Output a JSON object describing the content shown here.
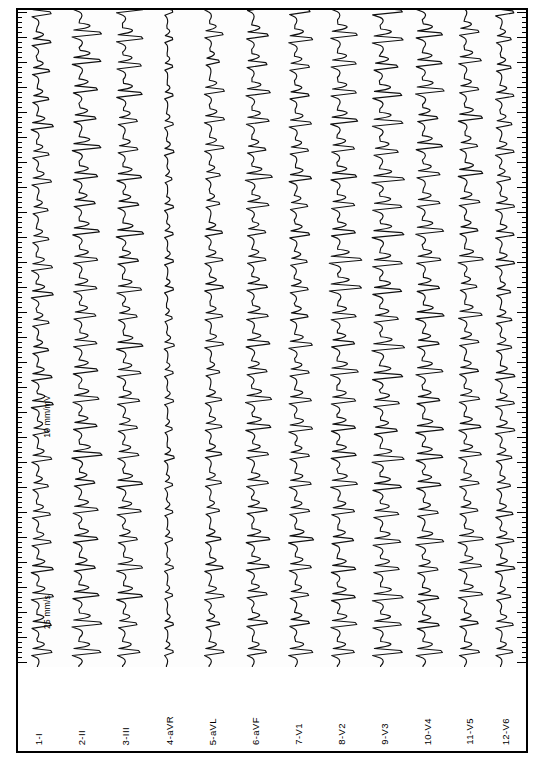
{
  "document": {
    "type": "12-lead electrocardiogram strip",
    "orientation": "rotated 90 degrees (landscape page, traces run vertically)"
  },
  "annotations": {
    "speed": "25 mm/s",
    "gain": "10 mm/mV"
  },
  "leads": [
    {
      "index": "1",
      "name": "I",
      "label": "1-I"
    },
    {
      "index": "2",
      "name": "II",
      "label": "2-II"
    },
    {
      "index": "3",
      "name": "III",
      "label": "3-III"
    },
    {
      "index": "4",
      "name": "aVR",
      "label": "4-aVR"
    },
    {
      "index": "5",
      "name": "aVL",
      "label": "5-aVL"
    },
    {
      "index": "6",
      "name": "aVF",
      "label": "6-aVF"
    },
    {
      "index": "7",
      "name": "V1",
      "label": "7-V1"
    },
    {
      "index": "8",
      "name": "V2",
      "label": "8-V2"
    },
    {
      "index": "9",
      "name": "V3",
      "label": "9-V3"
    },
    {
      "index": "10",
      "name": "V4",
      "label": "10-V4"
    },
    {
      "index": "11",
      "name": "V5",
      "label": "11-V5"
    },
    {
      "index": "12",
      "name": "V6",
      "label": "12-V6"
    }
  ],
  "chart_data": {
    "type": "line",
    "title": "",
    "subtitle": "",
    "xlabel": "",
    "ylabel": "",
    "grid": false,
    "legend_position": "bottom",
    "axis_note": "traces drawn vertically; time runs bottom-to-top along page height, amplitude runs horizontally per lead channel",
    "paper_speed_mm_per_s": 25,
    "gain_mm_per_mV": 10,
    "time_axis_ruler": {
      "minor_tick_px": 5,
      "major_tick_px": 25,
      "minor_per_major": 5
    },
    "categories": [
      "I",
      "II",
      "III",
      "aVR",
      "aVL",
      "aVF",
      "V1",
      "V2",
      "V3",
      "V4",
      "V5",
      "V6"
    ],
    "series": [
      {
        "name": "1-I",
        "baseline_px": 35,
        "amplitude_mm": 9,
        "beats": 22,
        "morphology": "wide biphasic complexes, overlapping"
      },
      {
        "name": "2-II",
        "baseline_px": 78,
        "amplitude_mm": 12,
        "beats": 22,
        "morphology": "tall broad complexes"
      },
      {
        "name": "3-III",
        "baseline_px": 122,
        "amplitude_mm": 11,
        "beats": 22,
        "morphology": "broad complexes"
      },
      {
        "name": "4-aVR",
        "baseline_px": 166,
        "amplitude_mm": 4,
        "beats": 22,
        "morphology": "low amplitude, narrow deflections"
      },
      {
        "name": "5-aVL",
        "baseline_px": 209,
        "amplitude_mm": 8,
        "beats": 22,
        "morphology": "moderate complexes"
      },
      {
        "name": "6-aVF",
        "baseline_px": 252,
        "amplitude_mm": 11,
        "beats": 22,
        "morphology": "broad complexes"
      },
      {
        "name": "7-V1",
        "baseline_px": 295,
        "amplitude_mm": 10,
        "beats": 22,
        "morphology": "broad complexes"
      },
      {
        "name": "8-V2",
        "baseline_px": 338,
        "amplitude_mm": 13,
        "beats": 22,
        "morphology": "large amplitude, overlapping neighbours"
      },
      {
        "name": "9-V3",
        "baseline_px": 381,
        "amplitude_mm": 13,
        "beats": 22,
        "morphology": "large amplitude"
      },
      {
        "name": "10-V4",
        "baseline_px": 424,
        "amplitude_mm": 12,
        "beats": 22,
        "morphology": "large amplitude"
      },
      {
        "name": "11-V5",
        "baseline_px": 466,
        "amplitude_mm": 10,
        "beats": 22,
        "morphology": "broad complexes"
      },
      {
        "name": "12-V6",
        "baseline_px": 502,
        "amplitude_mm": 8,
        "beats": 22,
        "morphology": "moderate complexes"
      }
    ]
  }
}
